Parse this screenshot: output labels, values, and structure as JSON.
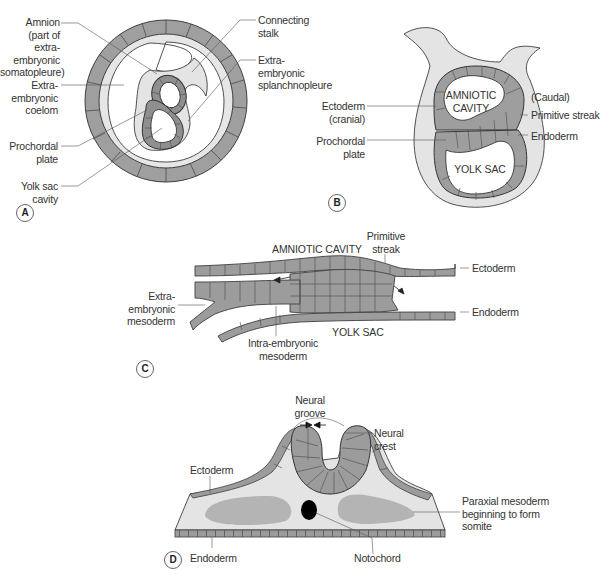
{
  "colors": {
    "cell_fill": "#9a9a9a",
    "cell_fill_light": "#a9a9a9",
    "cell_line": "#4a4a4a",
    "mesoderm_fill": "#e4e4e4",
    "somite_fill": "#b4b4b4",
    "notochord_fill": "#000000",
    "leader_line": "#555555",
    "background": "#ffffff"
  },
  "panels": {
    "a": {
      "badge": "A",
      "labels": {
        "amnion": "Amnion\n(part of extra-\nembryonic\nsomatopleure)",
        "extra_embryonic_coelom": "Extra-\nembryonic\ncoelom",
        "prochordal_plate": "Prochordal\nplate",
        "yolk_sac_cavity": "Yolk sac\ncavity",
        "connecting_stalk": "Connecting\nstalk",
        "extra_embryonic_splanchnopleure": "Extra-\nembryonic\nsplanchnopleure"
      }
    },
    "b": {
      "badge": "B",
      "labels": {
        "amniotic_cavity": "AMNIOTIC\nCAVITY",
        "yolk_sac": "YOLK SAC",
        "ectoderm_cranial": "Ectoderm\n(cranial)",
        "prochordal_plate": "Prochordal\nplate",
        "caudal": "(Caudal)",
        "primitive_streak": "Primitive streak",
        "endoderm": "Endoderm"
      }
    },
    "c": {
      "badge": "C",
      "labels": {
        "amniotic_cavity": "AMNIOTIC CAVITY",
        "primitive_streak": "Primitive\nstreak",
        "ectoderm": "Ectoderm",
        "endoderm": "Endoderm",
        "extra_embryonic_mesoderm": "Extra-\nembryonic\nmesoderm",
        "intra_embryonic_mesoderm": "Intra-embryonic\nmesoderm",
        "yolk_sac": "YOLK SAC"
      }
    },
    "d": {
      "badge": "D",
      "labels": {
        "neural_groove": "Neural\ngroove",
        "neural_crest": "Neural\ncrest",
        "ectoderm": "Ectoderm",
        "paraxial_mesoderm": "Paraxial mesoderm\nbeginning to form\nsomite",
        "endoderm": "Endoderm",
        "notochord": "Notochord"
      }
    }
  }
}
